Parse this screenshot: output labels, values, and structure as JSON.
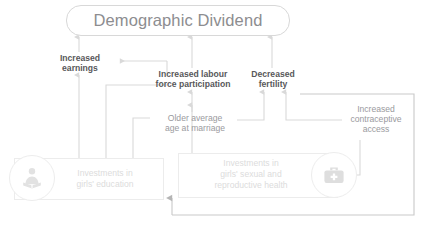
{
  "diagram": {
    "title": "Demographic Dividend",
    "accent_color": "#58585a",
    "muted_color": "#9a9a9e",
    "faint_color": "#dcdcdc",
    "line_color": "#d9d9d9",
    "line_color_strong": "#c9c9c9"
  },
  "nodes": {
    "increased_earnings": "Increased\nearnings",
    "increased_labour": "Increased labour\nforce participation",
    "decreased_fertility": "Decreased\nfertility",
    "older_marriage": "Older average\nage at marriage",
    "contraceptive_access": "Increased\ncontraceptive\naccess",
    "investments_education": "Investments in\ngirls' education",
    "investments_health": "Investments in\ngirls' sexual and\nreproductive health"
  },
  "icons": {
    "education_icon_name": "student-reading-book-icon",
    "health_icon_name": "medical-bag-icon"
  }
}
